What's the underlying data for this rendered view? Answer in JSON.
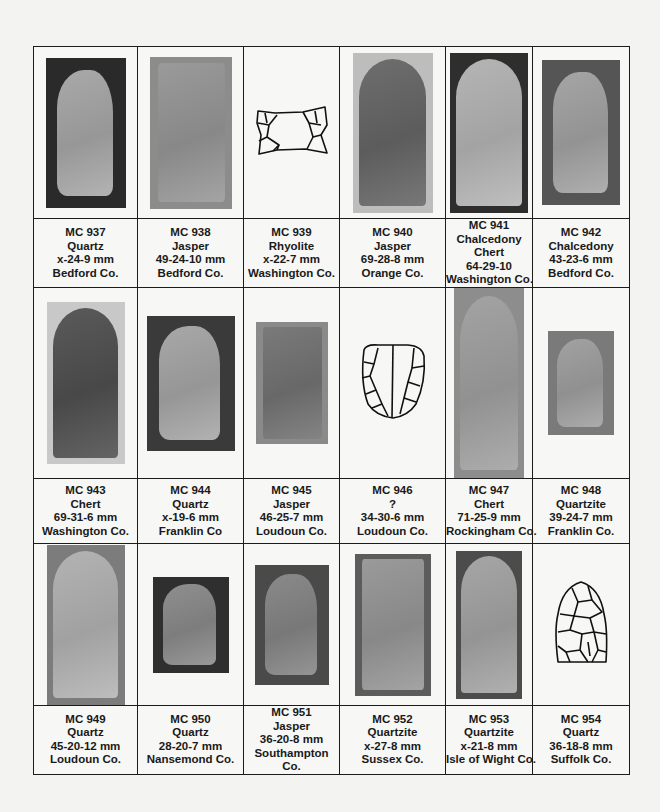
{
  "rows": [
    {
      "cells": [
        {
          "id": "MC 937",
          "material": "Quartz",
          "dims": "x-24-9 mm",
          "county": "Bedford Co.",
          "image": {
            "type": "photo",
            "bg": "#2a2a2a",
            "pt": "#a9a9a9",
            "w": 80,
            "h": 150,
            "shape": "tip-left"
          }
        },
        {
          "id": "MC 938",
          "material": "Jasper",
          "dims": "49-24-10 mm",
          "county": "Bedford Co.",
          "image": {
            "type": "photo",
            "bg": "#8c8c8c",
            "pt": "#9a9a9a",
            "w": 82,
            "h": 152,
            "shape": "rect"
          }
        },
        {
          "id": "MC 939",
          "material": "Rhyolite",
          "dims": "x-22-7 mm",
          "county": "Washington Co.",
          "image": {
            "type": "drawing",
            "shape": "base-fragment"
          }
        },
        {
          "id": "MC 940",
          "material": "Jasper",
          "dims": "69-28-8 mm",
          "county": "Orange Co.",
          "image": {
            "type": "photo",
            "bg": "#bdbdbd",
            "pt": "#6e6e6e",
            "w": 80,
            "h": 160,
            "shape": "fluted"
          }
        },
        {
          "id": "MC 941",
          "material": "Chalcedony",
          "material2": "Chert",
          "dims": "64-29-10",
          "county": "Washington Co.",
          "image": {
            "type": "photo",
            "bg": "#2e2e2e",
            "pt": "#b5b5b5",
            "w": 78,
            "h": 160,
            "shape": "fluted"
          }
        },
        {
          "id": "MC 942",
          "material": "Chalcedony",
          "dims": "43-23-6 mm",
          "county": "Bedford Co.",
          "image": {
            "type": "photo",
            "bg": "#555555",
            "pt": "#a5a5a5",
            "w": 78,
            "h": 145,
            "shape": "tip-left"
          }
        }
      ]
    },
    {
      "cells": [
        {
          "id": "MC 943",
          "material": "Chert",
          "dims": "69-31-6 mm",
          "county": "Washington Co.",
          "image": {
            "type": "photo",
            "bg": "#c8c8c8",
            "pt": "#5a5a5a",
            "w": 78,
            "h": 162,
            "shape": "fluted"
          }
        },
        {
          "id": "MC 944",
          "material": "Quartz",
          "dims": "x-19-6 mm",
          "county": "Franklin Co",
          "image": {
            "type": "photo",
            "bg": "#3a3a3a",
            "pt": "#a8a8a8",
            "w": 88,
            "h": 135,
            "shape": "tip-left"
          }
        },
        {
          "id": "MC 945",
          "material": "Jasper",
          "dims": "46-25-7 mm",
          "county": "Loudoun Co.",
          "image": {
            "type": "photo",
            "bg": "#8a8a8a",
            "pt": "#7a7a7a",
            "w": 72,
            "h": 122,
            "shape": "rect"
          }
        },
        {
          "id": "MC 946",
          "material": "?",
          "dims": "34-30-6 mm",
          "county": "Loudoun Co.",
          "image": {
            "type": "drawing",
            "shape": "base-round"
          }
        },
        {
          "id": "MC 947",
          "material": "Chert",
          "dims": "71-25-9 mm",
          "county": "Rockingham Co.",
          "image": {
            "type": "photo",
            "bg": "#8d8d8d",
            "pt": "#a3a3a3",
            "w": 70,
            "h": 190,
            "shape": "fluted"
          }
        },
        {
          "id": "MC 948",
          "material": "Quartzite",
          "dims": "39-24-7 mm",
          "county": "Franklin Co.",
          "image": {
            "type": "photo",
            "bg": "#7a7a7a",
            "pt": "#a2a2a2",
            "w": 66,
            "h": 104,
            "shape": "tip-left"
          }
        }
      ]
    },
    {
      "cells": [
        {
          "id": "MC 949",
          "material": "Quartz",
          "dims": "45-20-12 mm",
          "county": "Loudoun Co.",
          "image": {
            "type": "photo",
            "bg": "#7c7c7c",
            "pt": "#b3b3b3",
            "w": 78,
            "h": 160,
            "shape": "fluted"
          }
        },
        {
          "id": "MC 950",
          "material": "Quartz",
          "dims": "28-20-7 mm",
          "county": "Nansemond Co.",
          "image": {
            "type": "photo",
            "bg": "#2f2f2f",
            "pt": "#8f8f8f",
            "w": 76,
            "h": 96,
            "shape": "tip-left"
          }
        },
        {
          "id": "MC 951",
          "material": "Jasper",
          "dims": "36-20-8 mm",
          "county": "Southampton",
          "county2": "Co.",
          "image": {
            "type": "photo",
            "bg": "#4a4a4a",
            "pt": "#8a8a8a",
            "w": 74,
            "h": 120,
            "shape": "tip-left"
          }
        },
        {
          "id": "MC 952",
          "material": "Quartzite",
          "dims": "x-27-8 mm",
          "county": "Sussex Co.",
          "image": {
            "type": "photo",
            "bg": "#5c5c5c",
            "pt": "#9a9a9a",
            "w": 76,
            "h": 142,
            "shape": "rect"
          }
        },
        {
          "id": "MC 953",
          "material": "Quartzite",
          "dims": "x-21-8 mm",
          "county": "Isle of Wight Co.",
          "image": {
            "type": "photo",
            "bg": "#4c4c4c",
            "pt": "#a6a6a6",
            "w": 66,
            "h": 148,
            "shape": "fluted"
          }
        },
        {
          "id": "MC 954",
          "material": "Quartz",
          "dims": "36-18-8 mm",
          "county": "Suffolk Co.",
          "image": {
            "type": "drawing",
            "shape": "point"
          }
        }
      ]
    }
  ]
}
